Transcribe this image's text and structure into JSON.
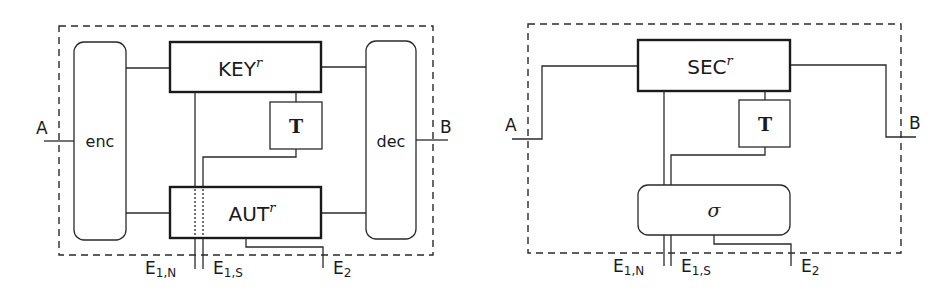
{
  "left_diagram": {
    "ports": {
      "left": "A",
      "right": "B"
    },
    "boxes": {
      "enc": "enc",
      "dec": "dec",
      "key": {
        "base": "KEY",
        "sup": "r"
      },
      "aut": {
        "base": "AUT",
        "sup": "r"
      },
      "t": "T"
    },
    "interfaces": {
      "e1n": {
        "base": "E",
        "sub": "1,N"
      },
      "e1s": {
        "base": "E",
        "sub": "1,S"
      },
      "e2": {
        "base": "E",
        "sub": "2"
      }
    }
  },
  "right_diagram": {
    "ports": {
      "left": "A",
      "right": "B"
    },
    "boxes": {
      "sec": {
        "base": "SEC",
        "sup": "r"
      },
      "t": "T",
      "sigma": "σ"
    },
    "interfaces": {
      "e1n": {
        "base": "E",
        "sub": "1,N"
      },
      "e1s": {
        "base": "E",
        "sub": "1,S"
      },
      "e2": {
        "base": "E",
        "sub": "2"
      }
    }
  }
}
